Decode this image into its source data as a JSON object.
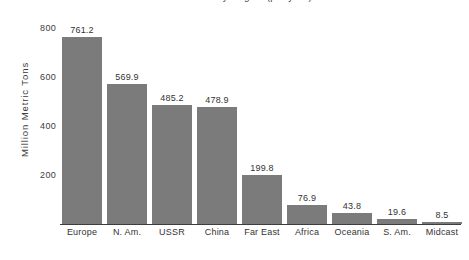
{
  "chart_data": {
    "type": "bar",
    "title": "World Carbon Dioxide Emissions by Region (per year)",
    "xlabel": "",
    "ylabel": "Million Metric Tons",
    "categories": [
      "Europe",
      "N. Am.",
      "USSR",
      "China",
      "Far East",
      "Africa",
      "Oceania",
      "S. Am.",
      "Midcast"
    ],
    "values": [
      761.2,
      569.9,
      485.2,
      478.9,
      199.8,
      76.9,
      43.8,
      19.6,
      8.5
    ],
    "value_labels": [
      "761.2",
      "569.9",
      "485.2",
      "478.9",
      "199.8",
      "76.9",
      "43.8",
      "19.6",
      "8.5"
    ],
    "yticks": [
      200,
      400,
      600,
      800
    ],
    "ytick_labels": [
      "200",
      "400",
      "600",
      "800"
    ],
    "ylim": [
      0,
      865
    ],
    "grid": false,
    "legend": false,
    "bar_color": "#7b7b7b",
    "axis_color": "#3d3d3d",
    "text_color": "#333333"
  }
}
